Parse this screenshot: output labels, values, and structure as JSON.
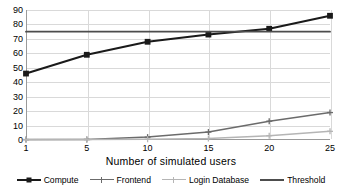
{
  "chart_data": {
    "type": "line",
    "title": "",
    "xlabel": "Number of simulated users",
    "ylabel": "",
    "categories": [
      "1",
      "5",
      "10",
      "15",
      "20",
      "25"
    ],
    "ylim": [
      0,
      90
    ],
    "yticks": [
      "0",
      "10",
      "20",
      "30",
      "40",
      "50",
      "60",
      "70",
      "80",
      "90"
    ],
    "grid": true,
    "legend_position": "bottom",
    "series": [
      {
        "name": "Compute",
        "values": [
          46,
          59,
          68,
          73,
          77,
          86
        ],
        "color": "#1a1a1a",
        "marker": "square"
      },
      {
        "name": "Frontend",
        "values": [
          0.3,
          0.4,
          2,
          5.5,
          13,
          19
        ],
        "color": "#6b6b6b",
        "marker": "cross"
      },
      {
        "name": "Login Database",
        "values": [
          0.2,
          0.3,
          0.5,
          1,
          3,
          6
        ],
        "color": "#b5b5b5",
        "marker": "cross"
      },
      {
        "name": "Threshold",
        "values": [
          75,
          75,
          75,
          75,
          75,
          75
        ],
        "color": "#4d4d4d",
        "marker": "none"
      }
    ]
  },
  "axis": {
    "x_title": "Number of simulated users",
    "x_ticks": [
      "1",
      "5",
      "10",
      "15",
      "20",
      "25"
    ],
    "y_ticks": [
      "90",
      "80",
      "70",
      "60",
      "50",
      "40",
      "30",
      "20",
      "10",
      "0"
    ]
  },
  "legend": {
    "items": [
      {
        "label": "Compute"
      },
      {
        "label": "Frontend"
      },
      {
        "label": "Login Database"
      },
      {
        "label": "Threshold"
      }
    ]
  },
  "colors": {
    "compute": "#1a1a1a",
    "frontend": "#6b6b6b",
    "login_database": "#b5b5b5",
    "threshold": "#4d4d4d",
    "grid": "#d9d9d9",
    "axis": "#9a9a9a"
  }
}
